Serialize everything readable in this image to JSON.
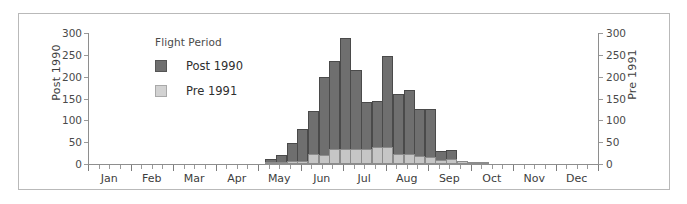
{
  "chart_data": {
    "type": "bar",
    "title": "",
    "subtitle": "",
    "xlabel": "",
    "ylabel": "Post 1990",
    "ylabel_right": "Pre 1991",
    "legend_title": "Flight Period",
    "legend_position": "inside-top-left",
    "grid": false,
    "ylim": [
      0,
      300
    ],
    "ylim_right": [
      0,
      300
    ],
    "yticks": [
      300,
      250,
      200,
      150,
      100,
      50,
      0
    ],
    "yticks_right": [
      300,
      250,
      200,
      150,
      100,
      50,
      0
    ],
    "xlabel_ticks": [
      "Jan",
      "Feb",
      "Mar",
      "Apr",
      "May",
      "Jun",
      "Jul",
      "Aug",
      "Sep",
      "Oct",
      "Nov",
      "Dec"
    ],
    "x_minor_ticks_per_month": 4,
    "note": "Overlaid bar histogram of flight records by fortnight; dark bars = Post 1990 (left axis), light bars = Pre 1991 (right axis), drawn in front.",
    "series": [
      {
        "name": "Post 1990",
        "color": "#6f6f6f",
        "axis": "left",
        "x": [
          "May 1",
          "May 2",
          "May 3",
          "May 4",
          "Jun 1",
          "Jun 2",
          "Jun 3",
          "Jun 4",
          "Jul 1",
          "Jul 2",
          "Jul 3",
          "Jul 4",
          "Aug 1",
          "Aug 2",
          "Aug 3",
          "Aug 4",
          "Sep 1",
          "Sep 2",
          "Sep 3",
          "Sep 4",
          "Oct 1"
        ],
        "values": [
          12,
          20,
          48,
          80,
          122,
          200,
          235,
          288,
          215,
          143,
          145,
          248,
          160,
          170,
          125,
          125,
          30,
          32,
          8,
          4,
          3
        ]
      },
      {
        "name": "Pre 1991",
        "color": "#c6c6c6",
        "axis": "right",
        "x": [
          "May 1",
          "May 2",
          "May 3",
          "May 4",
          "Jun 1",
          "Jun 2",
          "Jun 3",
          "Jun 4",
          "Jul 1",
          "Jul 2",
          "Jul 3",
          "Jul 4",
          "Aug 1",
          "Aug 2",
          "Aug 3",
          "Aug 4",
          "Sep 1",
          "Sep 2",
          "Sep 3",
          "Sep 4",
          "Oct 1"
        ],
        "values": [
          4,
          5,
          6,
          8,
          22,
          20,
          35,
          35,
          35,
          35,
          38,
          38,
          24,
          22,
          18,
          16,
          10,
          12,
          6,
          3,
          2
        ]
      }
    ]
  },
  "legend": {
    "title": "Flight Period",
    "items": [
      {
        "label": "Post 1990",
        "swatch": "post"
      },
      {
        "label": "Pre 1991",
        "swatch": "pre"
      }
    ]
  }
}
